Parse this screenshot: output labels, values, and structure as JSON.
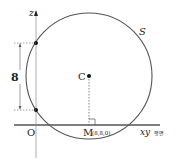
{
  "diagram": {
    "sphere_label": "S",
    "center_label": "C",
    "origin_label": "O",
    "axis_z_label": "z",
    "foot_label": "M",
    "foot_coords": "(8,8,0)",
    "plane_label": "xy",
    "plane_suffix": "평면",
    "segment_length": "8",
    "colors": {
      "stroke": "#555555",
      "axis": "#999999",
      "text": "#222222"
    }
  }
}
